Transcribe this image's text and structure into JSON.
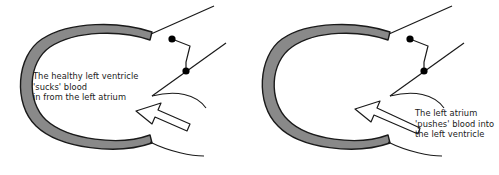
{
  "figure": {
    "background_color": "#ffffff",
    "width": 499,
    "height": 175
  },
  "colors": {
    "myocardium_fill": "#898989",
    "outline": "#1a1a1a",
    "arrow_fill": "#ffffff",
    "arrow_outline": "#1a1a1a",
    "valve_dot": "#000000",
    "text": "#1a1a1a"
  },
  "panels": [
    {
      "id": "healthy-ventricle",
      "side": "left",
      "caption_lines": [
        "The healthy left ventricle",
        "'sucks' blood",
        "in from the left atrium"
      ],
      "ventricle_shape": "open-c-ring",
      "arrow": {
        "name": "blood-flow-arrow",
        "style": "hollow-block-arrow",
        "direction": "up-left",
        "length": "short"
      },
      "valve": {
        "name": "mitral-valve-leaflets",
        "leaflet_count": 2,
        "dot_count": 2
      }
    },
    {
      "id": "atrial-push-ventricle",
      "side": "right",
      "caption_lines": [
        "The left atrium",
        "'pushes' blood into",
        "the left ventricle"
      ],
      "ventricle_shape": "open-c-ring-narrow",
      "arrow": {
        "name": "blood-flow-arrow",
        "style": "hollow-block-arrow",
        "direction": "up-left",
        "length": "long"
      },
      "valve": {
        "name": "mitral-valve-leaflets",
        "leaflet_count": 2,
        "dot_count": 2
      }
    }
  ]
}
